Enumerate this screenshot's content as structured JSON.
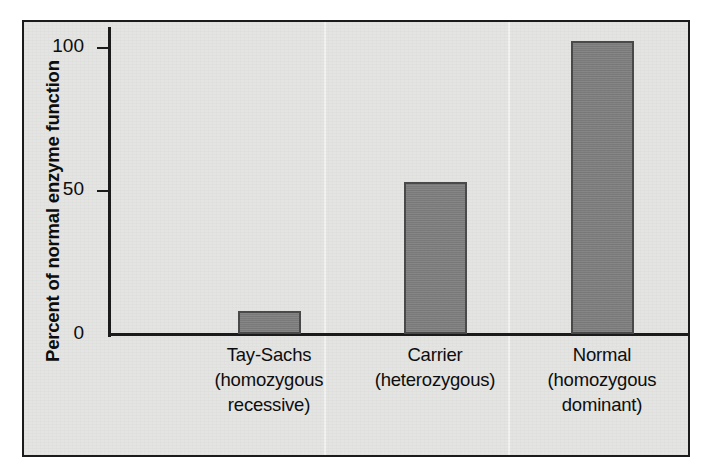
{
  "figure": {
    "background_color": "#e4e4e2",
    "border_color": "#1b1b1b",
    "bar_fill_color": "#7f7f7f",
    "bar_border_color": "#4a4a4a"
  },
  "axes": {
    "ylabel": "Percent of normal enzyme function",
    "ytick_labels": [
      "0",
      "50",
      "100"
    ],
    "ytick_values": [
      0,
      50,
      100
    ]
  },
  "chart_data": {
    "type": "bar",
    "title": "",
    "xlabel": "",
    "ylabel": "Percent of normal enzyme function",
    "ylim": [
      0,
      110
    ],
    "grid": false,
    "legend": null,
    "categories": [
      "Tay-Sachs (homozygous recessive)",
      "Carrier (heterozygous)",
      "Normal (homozygous dominant)"
    ],
    "category_lines": [
      [
        "Tay-Sachs",
        "(homozygous",
        "recessive)"
      ],
      [
        "Carrier",
        "(heterozygous)"
      ],
      [
        "Normal",
        "(homozygous",
        "dominant)"
      ]
    ],
    "values": [
      8,
      53,
      102
    ],
    "bar_color": "#7f7f7f",
    "ytick_labels": [
      "0",
      "50",
      "100"
    ],
    "ytick_values": [
      0,
      50,
      100
    ]
  }
}
